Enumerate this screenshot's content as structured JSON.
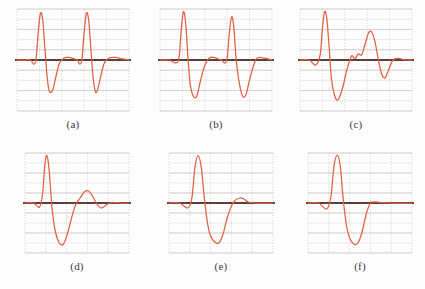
{
  "figure": {
    "background_color": "#fdfdfd",
    "trace_color": "#e0603f",
    "baseline_color": "#5b4038",
    "grid_major_color": "#c9c3bd",
    "grid_minor_color": "#e6dedd",
    "caption_color": "#3b3b3b"
  },
  "chart_data": {
    "type": "line",
    "title": "",
    "xlabel": "",
    "ylabel": "",
    "grid": true,
    "legend_position": "none",
    "shared_axes": {
      "xlim": [
        0,
        100
      ],
      "ylim": [
        -1,
        1
      ],
      "baseline_y": 0,
      "grid_rows": 10,
      "grid_cols": 5
    },
    "panels": [
      {
        "id": "a",
        "caption": "(a)",
        "description": "two consecutive normal QRS beats with tall R waves and deep S waves",
        "beats": 2,
        "x": [
          0,
          6,
          12,
          15,
          17,
          19,
          21,
          23,
          25,
          27,
          29,
          32,
          35,
          38,
          42,
          46,
          50,
          54,
          56,
          58,
          60,
          62,
          64,
          66,
          68,
          70,
          72,
          75,
          78,
          82,
          88,
          94,
          100
        ],
        "y": [
          0.0,
          0.0,
          0.0,
          -0.08,
          0.02,
          0.55,
          0.92,
          0.78,
          0.2,
          -0.35,
          -0.62,
          -0.58,
          -0.3,
          -0.06,
          0.04,
          0.05,
          0.03,
          0.0,
          -0.08,
          0.02,
          0.55,
          0.92,
          0.78,
          0.2,
          -0.35,
          -0.62,
          -0.58,
          -0.3,
          -0.06,
          0.04,
          0.05,
          0.02,
          0.0
        ]
      },
      {
        "id": "b",
        "caption": "(b)",
        "description": "two consecutive beats, second R slightly lower, broad deep S waves",
        "beats": 2,
        "x": [
          0,
          8,
          14,
          17,
          19,
          21,
          23,
          25,
          27,
          30,
          33,
          36,
          40,
          44,
          48,
          52,
          55,
          58,
          60,
          62,
          64,
          66,
          68,
          71,
          74,
          77,
          81,
          86,
          92,
          100
        ],
        "y": [
          0.0,
          0.0,
          -0.06,
          0.05,
          0.6,
          0.95,
          0.7,
          0.05,
          -0.48,
          -0.72,
          -0.7,
          -0.42,
          -0.1,
          0.04,
          0.05,
          0.02,
          0.0,
          -0.06,
          0.05,
          0.55,
          0.85,
          0.62,
          0.02,
          -0.48,
          -0.72,
          -0.66,
          -0.3,
          0.02,
          0.04,
          0.0
        ]
      },
      {
        "id": "c",
        "caption": "(c)",
        "description": "one large QRS complex followed by a smaller secondary complex (ectopic/premature beat)",
        "beats": 2,
        "x": [
          0,
          8,
          14,
          18,
          20,
          22,
          24,
          26,
          28,
          31,
          34,
          38,
          42,
          46,
          49,
          52,
          55,
          58,
          61,
          64,
          67,
          70,
          73,
          76,
          79,
          83,
          88,
          94,
          100
        ],
        "y": [
          0.0,
          0.0,
          -0.1,
          0.1,
          0.62,
          0.95,
          0.8,
          0.25,
          -0.35,
          -0.7,
          -0.78,
          -0.55,
          -0.18,
          0.08,
          0.02,
          0.12,
          0.1,
          0.3,
          0.52,
          0.55,
          0.35,
          0.0,
          -0.28,
          -0.35,
          -0.2,
          0.0,
          0.03,
          0.0,
          0.0
        ]
      },
      {
        "id": "d",
        "caption": "(d)",
        "description": "single QRS with deep wide S wave followed by damped oscillation / T wave",
        "beats": 1,
        "x": [
          0,
          8,
          14,
          17,
          19,
          21,
          23,
          26,
          29,
          33,
          37,
          41,
          45,
          49,
          53,
          57,
          61,
          65,
          69,
          73,
          77,
          81,
          86,
          92,
          100
        ],
        "y": [
          0.0,
          0.0,
          -0.08,
          0.2,
          0.75,
          0.95,
          0.7,
          -0.1,
          -0.55,
          -0.8,
          -0.82,
          -0.6,
          -0.28,
          -0.02,
          0.1,
          0.22,
          0.24,
          0.14,
          -0.02,
          -0.1,
          -0.06,
          0.0,
          0.01,
          0.0,
          0.0
        ]
      },
      {
        "id": "e",
        "caption": "(e)",
        "description": "single tall narrow R wave with deep broad S wave and small T wave",
        "beats": 1,
        "x": [
          0,
          10,
          18,
          22,
          25,
          28,
          31,
          34,
          37,
          40,
          44,
          48,
          52,
          56,
          60,
          64,
          68,
          72,
          76,
          82,
          90,
          100
        ],
        "y": [
          0.0,
          0.0,
          -0.1,
          0.1,
          0.72,
          0.95,
          0.72,
          0.1,
          -0.4,
          -0.66,
          -0.78,
          -0.8,
          -0.62,
          -0.3,
          -0.06,
          0.06,
          0.1,
          0.08,
          0.02,
          0.0,
          0.0,
          0.0
        ]
      },
      {
        "id": "f",
        "caption": "(f)",
        "description": "single tall R wave with deep rounded S wave returning to baseline",
        "beats": 1,
        "x": [
          0,
          10,
          18,
          22,
          25,
          28,
          31,
          34,
          37,
          40,
          44,
          48,
          52,
          56,
          60,
          64,
          70,
          78,
          88,
          100
        ],
        "y": [
          0.0,
          0.0,
          -0.12,
          0.12,
          0.74,
          0.96,
          0.74,
          0.05,
          -0.45,
          -0.7,
          -0.82,
          -0.8,
          -0.58,
          -0.22,
          0.0,
          0.02,
          0.01,
          0.0,
          0.0,
          0.0
        ]
      }
    ]
  }
}
